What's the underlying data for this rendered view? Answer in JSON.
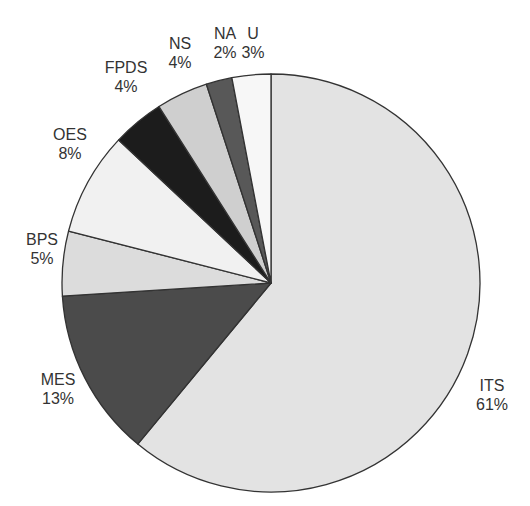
{
  "chart_data": {
    "type": "pie",
    "title": "",
    "start_angle_deg": 0,
    "direction": "clockwise",
    "center": [
      271,
      283
    ],
    "radius": 209,
    "stroke_color": "#333333",
    "slices": [
      {
        "label": "ITS",
        "value": 61,
        "percent_label": "61%",
        "color": "#e3e3e3",
        "label_pos": [
          492,
          395
        ]
      },
      {
        "label": "MES",
        "value": 13,
        "percent_label": "13%",
        "color": "#4b4b4b",
        "label_pos": [
          58,
          389
        ]
      },
      {
        "label": "BPS",
        "value": 5,
        "percent_label": "5%",
        "color": "#dcdcdc",
        "label_pos": [
          42,
          249
        ]
      },
      {
        "label": "OES",
        "value": 8,
        "percent_label": "8%",
        "color": "#f1f1f1",
        "label_pos": [
          70,
          144
        ]
      },
      {
        "label": "FPDS",
        "value": 4,
        "percent_label": "4%",
        "color": "#1c1c1c",
        "label_pos": [
          126,
          77
        ]
      },
      {
        "label": "NS",
        "value": 4,
        "percent_label": "4%",
        "color": "#cfcfcf",
        "label_pos": [
          180,
          53
        ]
      },
      {
        "label": "NA",
        "value": 2,
        "percent_label": "2%",
        "color": "#585858",
        "label_pos": [
          225,
          43
        ]
      },
      {
        "label": "U",
        "value": 3,
        "percent_label": "3%",
        "color": "#f7f7f7",
        "label_pos": [
          253,
          43
        ]
      }
    ],
    "categories": [
      "ITS",
      "MES",
      "BPS",
      "OES",
      "FPDS",
      "NS",
      "NA",
      "U"
    ],
    "values": [
      61,
      13,
      5,
      8,
      4,
      4,
      2,
      3
    ],
    "legend": "none (labels placed outside slices)"
  }
}
